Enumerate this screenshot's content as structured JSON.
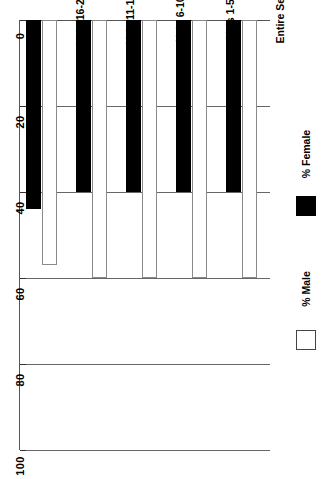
{
  "chart_data": {
    "type": "bar",
    "orientation": "horizontal-rotated",
    "title": "",
    "xlabel": "",
    "ylabel": "",
    "categories": [
      "Entire Set",
      "Vols 1-5",
      "Vols 6-10",
      "Vols 11-15",
      "Vols 16-20"
    ],
    "series": [
      {
        "name": "% Male",
        "color": "#ffffff",
        "values": [
          60,
          60,
          60,
          60,
          57
        ]
      },
      {
        "name": "% Female",
        "color": "#000000",
        "values": [
          40,
          40,
          40,
          40,
          44
        ]
      }
    ],
    "axis": {
      "ticks": [
        0,
        20,
        40,
        60,
        80,
        100
      ],
      "tick_labels": [
        "0",
        "20",
        "40",
        "60",
        "80",
        "100"
      ],
      "lim": [
        0,
        100
      ],
      "grid": true
    },
    "legend": {
      "position": "right",
      "entries": [
        {
          "label": "% Male",
          "swatch": "open-square-swatch"
        },
        {
          "label": "% Female",
          "swatch": "filled-square-swatch"
        }
      ]
    }
  }
}
